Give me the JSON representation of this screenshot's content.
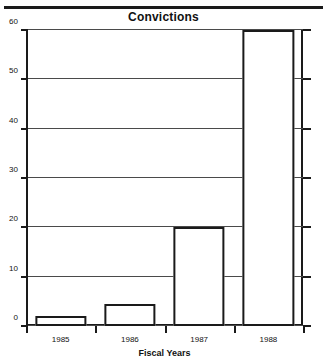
{
  "chart_data": {
    "type": "bar",
    "title": "Convictions",
    "xlabel": "Fiscal Years",
    "ylabel": "",
    "categories": [
      "1985",
      "1986",
      "1987",
      "1988"
    ],
    "values": [
      2,
      4.5,
      20,
      60
    ],
    "series": [
      {
        "name": "Convictions",
        "values": [
          2,
          4.5,
          20,
          60
        ]
      }
    ],
    "ylim": [
      0,
      60
    ],
    "yticks": [
      0,
      10,
      20,
      30,
      40,
      50,
      60
    ],
    "ytick_labels": [
      "0",
      "10",
      "20",
      "30",
      "40",
      "50",
      "60"
    ],
    "grid": true,
    "legend": false,
    "bar_style": {
      "fill": "#ffffff",
      "edge": "#1a1a1a"
    }
  },
  "figure": {
    "background": "#ffffff",
    "axis_color": "#1a1a1a",
    "grid_color": "#4a4a4a"
  }
}
